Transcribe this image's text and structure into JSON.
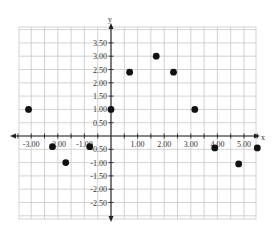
{
  "chart_data": {
    "type": "scatter",
    "title": "",
    "xlabel": "x",
    "ylabel": "y",
    "xlim": [
      -3.5,
      5.5
    ],
    "ylim": [
      -3.0,
      4.0
    ],
    "grid": true,
    "grid_step": 0.5,
    "legend": null,
    "x_ticks": [
      -3.0,
      -2.0,
      -1.0,
      1.0,
      2.0,
      3.0,
      4.0,
      5.0
    ],
    "x_tick_labels": [
      "-3.00",
      "-2.00",
      "-1.00",
      "1.00",
      "2.00",
      "3.00",
      "4.00",
      "5.00"
    ],
    "y_ticks": [
      3.5,
      3.0,
      2.5,
      2.0,
      1.5,
      1.0,
      0.5,
      -0.5,
      -1.0,
      -1.5,
      -2.0,
      -2.5
    ],
    "y_tick_labels": [
      "3.50",
      "3.00",
      "2.50",
      "2.00",
      "1.50",
      "1.00",
      "0.50",
      "-0.50",
      "-1.00",
      "-1.50",
      "-2.00",
      "-2.50"
    ],
    "series": [
      {
        "name": "points",
        "color": "#111111",
        "points": [
          {
            "x": -3.1,
            "y": 1.0
          },
          {
            "x": -2.2,
            "y": -0.4
          },
          {
            "x": -1.7,
            "y": -1.0
          },
          {
            "x": -0.8,
            "y": -0.4
          },
          {
            "x": 0.0,
            "y": 1.0
          },
          {
            "x": 0.7,
            "y": 2.4
          },
          {
            "x": 1.7,
            "y": 3.0
          },
          {
            "x": 2.35,
            "y": 2.4
          },
          {
            "x": 3.15,
            "y": 1.0
          },
          {
            "x": 3.9,
            "y": -0.45
          },
          {
            "x": 4.8,
            "y": -1.05
          },
          {
            "x": 5.5,
            "y": -0.45
          }
        ]
      }
    ]
  },
  "labels": {
    "x_axis": "x",
    "y_axis": "y"
  }
}
